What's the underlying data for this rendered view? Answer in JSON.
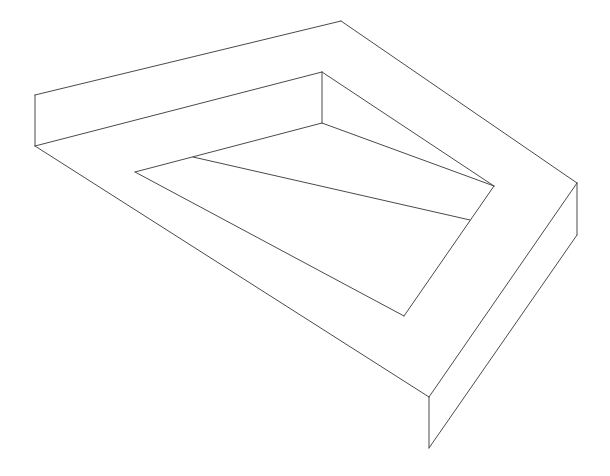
{
  "figure": {
    "stroke_color": "#4a4a4a",
    "background": "#ffffff",
    "width": 610,
    "height": 476,
    "segments": [
      {
        "name": "outer-top-left-edge",
        "x1": 35,
        "y1": 95,
        "x2": 341,
        "y2": 21
      },
      {
        "name": "outer-top-right-edge",
        "x1": 341,
        "y1": 21,
        "x2": 577,
        "y2": 183
      },
      {
        "name": "left-vertical-edge",
        "x1": 35,
        "y1": 95,
        "x2": 35,
        "y2": 146
      },
      {
        "name": "left-lower-top-edge",
        "x1": 35,
        "y1": 146,
        "x2": 322,
        "y2": 72
      },
      {
        "name": "inner-top-vertical",
        "x1": 322,
        "y1": 72,
        "x2": 322,
        "y2": 123
      },
      {
        "name": "inner-top-right-edge",
        "x1": 322,
        "y1": 72,
        "x2": 494,
        "y2": 186
      },
      {
        "name": "right-vertical-edge",
        "x1": 577,
        "y1": 183,
        "x2": 577,
        "y2": 235
      },
      {
        "name": "right-front-top-edge",
        "x1": 577,
        "y1": 183,
        "x2": 429,
        "y2": 397
      },
      {
        "name": "right-front-bottom-edge",
        "x1": 577,
        "y1": 235,
        "x2": 429,
        "y2": 448
      },
      {
        "name": "bottom-vertical-edge",
        "x1": 429,
        "y1": 397,
        "x2": 429,
        "y2": 448
      },
      {
        "name": "outer-left-long-edge",
        "x1": 35,
        "y1": 146,
        "x2": 429,
        "y2": 397
      },
      {
        "name": "left-bottom-face-edge",
        "x1": 35,
        "y1": 146,
        "x2": 35,
        "y2": 146
      },
      {
        "name": "bottom-face-lower-edge",
        "x1": 429,
        "y1": 448,
        "x2": 429,
        "y2": 448
      },
      {
        "name": "inner-hole-top-edge",
        "x1": 135,
        "y1": 172,
        "x2": 322,
        "y2": 123
      },
      {
        "name": "inner-hole-left-edge",
        "x1": 135,
        "y1": 172,
        "x2": 404,
        "y2": 316
      },
      {
        "name": "inner-hole-right-edge",
        "x1": 494,
        "y1": 186,
        "x2": 404,
        "y2": 316
      },
      {
        "name": "inner-divider-line",
        "x1": 193,
        "y1": 157,
        "x2": 470,
        "y2": 220
      },
      {
        "name": "inner-upper-right-edge",
        "x1": 322,
        "y1": 123,
        "x2": 494,
        "y2": 186
      }
    ]
  }
}
